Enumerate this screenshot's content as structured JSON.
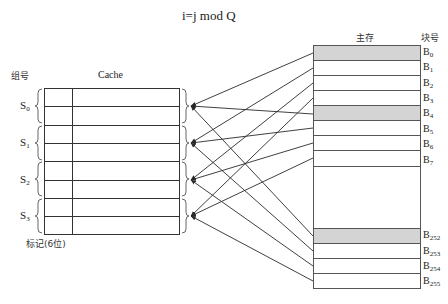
{
  "title": "i=j mod Q",
  "cache": {
    "group_header": "组号",
    "label": "Cache",
    "tag_label": "标记(6位)",
    "rows_per_group": 2,
    "groups": [
      {
        "name": "S",
        "sub": "0"
      },
      {
        "name": "S",
        "sub": "1"
      },
      {
        "name": "S",
        "sub": "2"
      },
      {
        "name": "S",
        "sub": "3"
      }
    ]
  },
  "main_memory": {
    "label": "主存",
    "block_header": "块号",
    "ellipsis": "⋮",
    "blocks": [
      {
        "name": "B",
        "sub": "0",
        "shaded": true,
        "group": 0
      },
      {
        "name": "B",
        "sub": "1",
        "shaded": false,
        "group": 1
      },
      {
        "name": "B",
        "sub": "2",
        "shaded": false,
        "group": 2
      },
      {
        "name": "B",
        "sub": "3",
        "shaded": false,
        "group": 3
      },
      {
        "name": "B",
        "sub": "4",
        "shaded": true,
        "group": 0
      },
      {
        "name": "B",
        "sub": "5",
        "shaded": false,
        "group": 1
      },
      {
        "name": "B",
        "sub": "6",
        "shaded": false,
        "group": 2
      },
      {
        "name": "B",
        "sub": "7",
        "shaded": false,
        "group": 3
      },
      {
        "name": "B",
        "sub": "252",
        "shaded": true,
        "group": 0
      },
      {
        "name": "B",
        "sub": "253",
        "shaded": false,
        "group": 1
      },
      {
        "name": "B",
        "sub": "254",
        "shaded": false,
        "group": 2
      },
      {
        "name": "B",
        "sub": "255",
        "shaded": false,
        "group": 3
      }
    ]
  },
  "colors": {
    "line": "#2a2a2a",
    "shaded_block": "#d4d4d4",
    "grid": "#333333"
  }
}
